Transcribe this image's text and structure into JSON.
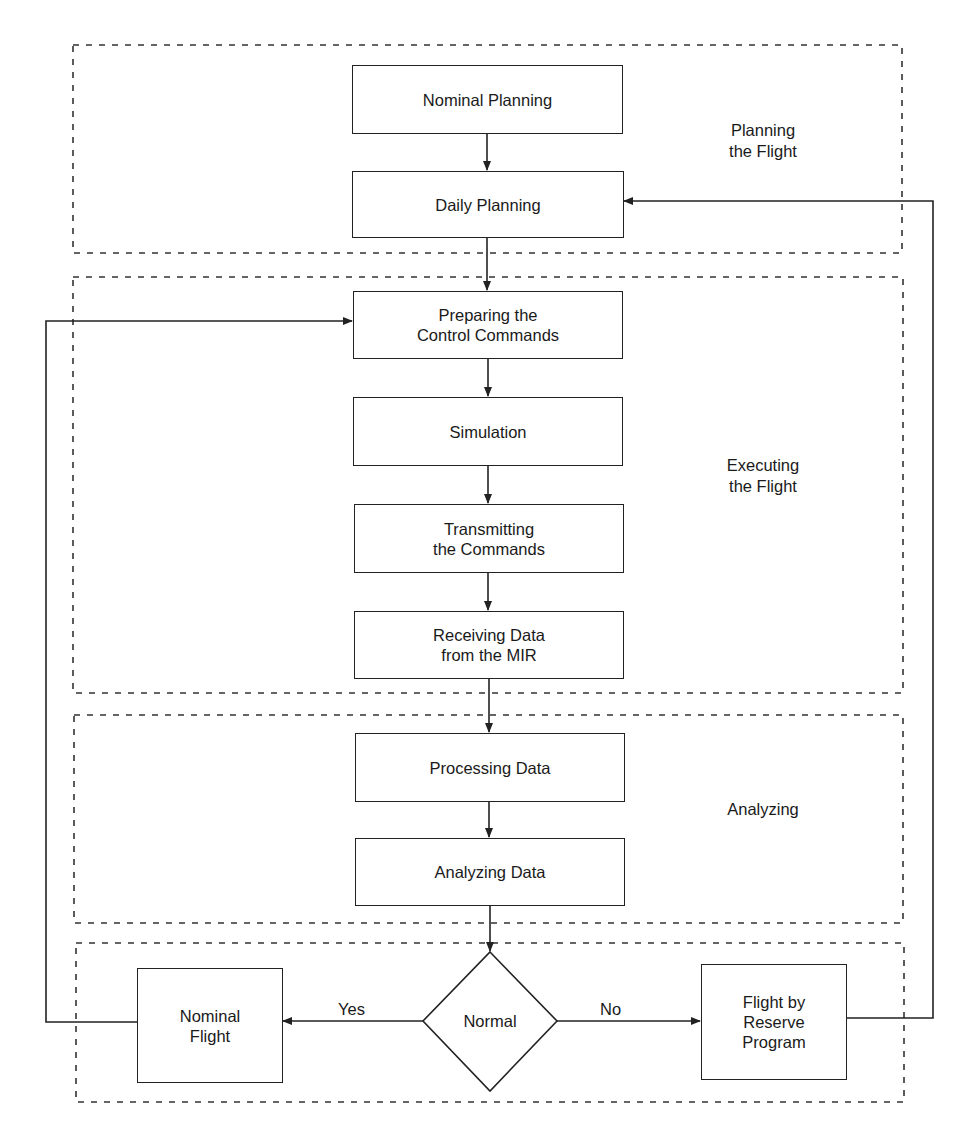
{
  "diagram": {
    "type": "flowchart",
    "sections": [
      {
        "id": "planning",
        "label": "Planning\nthe Flight"
      },
      {
        "id": "executing",
        "label": "Executing\nthe Flight"
      },
      {
        "id": "analyzing",
        "label": "Analyzing"
      },
      {
        "id": "decision",
        "label": ""
      }
    ],
    "nodes": [
      {
        "id": "nominal_planning",
        "label": "Nominal Planning"
      },
      {
        "id": "daily_planning",
        "label": "Daily Planning"
      },
      {
        "id": "preparing_commands",
        "label": "Preparing the\nControl Commands"
      },
      {
        "id": "simulation",
        "label": "Simulation"
      },
      {
        "id": "transmitting",
        "label": "Transmitting\nthe Commands"
      },
      {
        "id": "receiving",
        "label": "Receiving Data\nfrom the MIR"
      },
      {
        "id": "processing",
        "label": "Processing Data"
      },
      {
        "id": "analyzing_data",
        "label": "Analyzing Data"
      },
      {
        "id": "normal",
        "label": "Normal",
        "shape": "diamond"
      },
      {
        "id": "nominal_flight",
        "label": "Nominal\nFlight"
      },
      {
        "id": "reserve_flight",
        "label": "Flight by\nReserve\nProgram"
      }
    ],
    "edges": [
      {
        "from": "nominal_planning",
        "to": "daily_planning",
        "label": ""
      },
      {
        "from": "daily_planning",
        "to": "preparing_commands",
        "label": ""
      },
      {
        "from": "preparing_commands",
        "to": "simulation",
        "label": ""
      },
      {
        "from": "simulation",
        "to": "transmitting",
        "label": ""
      },
      {
        "from": "transmitting",
        "to": "receiving",
        "label": ""
      },
      {
        "from": "receiving",
        "to": "processing",
        "label": ""
      },
      {
        "from": "processing",
        "to": "analyzing_data",
        "label": ""
      },
      {
        "from": "analyzing_data",
        "to": "normal",
        "label": ""
      },
      {
        "from": "normal",
        "to": "nominal_flight",
        "label": "Yes"
      },
      {
        "from": "normal",
        "to": "reserve_flight",
        "label": "No"
      },
      {
        "from": "nominal_flight",
        "to": "preparing_commands",
        "label": ""
      },
      {
        "from": "reserve_flight",
        "to": "daily_planning",
        "label": ""
      }
    ],
    "colors": {
      "stroke": "#222222",
      "dash": "#333333",
      "background": "#ffffff"
    }
  }
}
